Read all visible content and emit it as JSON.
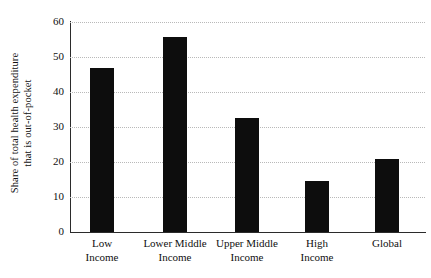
{
  "chart_data": {
    "type": "bar",
    "title": "",
    "xlabel": "",
    "ylabel": "Share of total health expenditure that is out-of-pocket",
    "ylabel_lines": [
      "Share of total health expenditure",
      "that is out-of-pocket"
    ],
    "categories": [
      "Low Income",
      "Lower Middle Income",
      "Upper Middle Income",
      "High Income",
      "Global"
    ],
    "category_lines": [
      [
        "Low",
        "Income"
      ],
      [
        "Lower Middle",
        "Income"
      ],
      [
        "Upper Middle",
        "Income"
      ],
      [
        "High",
        "Income"
      ],
      [
        "Global"
      ]
    ],
    "values": [
      47,
      55.6,
      32.6,
      14.7,
      21
    ],
    "ylim": [
      0,
      60
    ],
    "yticks": [
      0,
      10,
      20,
      30,
      40,
      50,
      60
    ],
    "ytick_labels": [
      "0",
      "10",
      "20",
      "30",
      "40",
      "50",
      "60"
    ],
    "grid": true,
    "grid_axis": "y",
    "grid_style": "dotted",
    "legend": false,
    "colors": {
      "bar": "#0d0d0d",
      "grid": "#b9b9b9",
      "axis": "#2b2b2b",
      "text": "#101010",
      "background": "#ffffff"
    }
  }
}
